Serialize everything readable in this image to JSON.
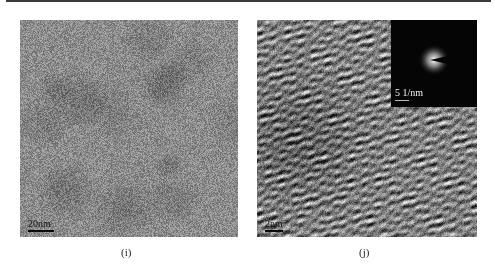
{
  "figure": {
    "panels": [
      {
        "id": "i",
        "caption": "(i)",
        "image_type": "TEM micrograph",
        "scale_bar": "20nm"
      },
      {
        "id": "j",
        "caption": "(j)",
        "image_type": "HRTEM micrograph",
        "scale_bar": "2nm",
        "inset": {
          "image_type": "SAED diffraction pattern",
          "scale_bar": "5 1/nm"
        }
      }
    ]
  }
}
